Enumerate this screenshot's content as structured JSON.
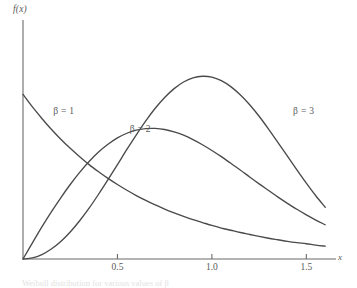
{
  "figure": {
    "background": "#ffffff",
    "curve_color": "#4a4a4a",
    "axis_color": "#6b6b6b",
    "text_color": "#5a5a5a",
    "caption": "Weibull distribution for various values of β"
  },
  "axes": {
    "ylabel": "f(x)",
    "xlabel": "x",
    "xticks": [
      {
        "value": 0.5,
        "label": "0.5"
      },
      {
        "value": 1.0,
        "label": "1.0"
      },
      {
        "value": 1.5,
        "label": "1.5"
      }
    ]
  },
  "chart_data": {
    "type": "line",
    "title": "",
    "xlabel": "x",
    "ylabel": "f(x)",
    "xlim": [
      0,
      1.62
    ],
    "ylim": [
      0,
      1.0
    ],
    "grid": false,
    "legend": "inline-annotations",
    "x": [
      0.0,
      0.05,
      0.1,
      0.15,
      0.2,
      0.25,
      0.3,
      0.35,
      0.4,
      0.45,
      0.5,
      0.55,
      0.6,
      0.65,
      0.7,
      0.75,
      0.8,
      0.85,
      0.9,
      0.95,
      1.0,
      1.05,
      1.1,
      1.15,
      1.2,
      1.25,
      1.3,
      1.35,
      1.4,
      1.45,
      1.5,
      1.55,
      1.6
    ],
    "series": [
      {
        "name": "β = 1",
        "label": "β = 1",
        "label_x": 0.16,
        "label_y": 0.665,
        "values": [
          0.745,
          0.688,
          0.636,
          0.587,
          0.542,
          0.501,
          0.463,
          0.427,
          0.395,
          0.365,
          0.337,
          0.311,
          0.287,
          0.265,
          0.245,
          0.226,
          0.209,
          0.193,
          0.178,
          0.165,
          0.152,
          0.14,
          0.13,
          0.12,
          0.111,
          0.102,
          0.094,
          0.087,
          0.08,
          0.074,
          0.069,
          0.063,
          0.058
        ]
      },
      {
        "name": "β = 2",
        "label": "β = 2",
        "label_x": 0.565,
        "label_y": 0.585,
        "values": [
          0.0,
          0.073,
          0.145,
          0.213,
          0.277,
          0.337,
          0.392,
          0.441,
          0.484,
          0.519,
          0.548,
          0.569,
          0.583,
          0.59,
          0.591,
          0.586,
          0.575,
          0.56,
          0.54,
          0.517,
          0.491,
          0.463,
          0.433,
          0.403,
          0.371,
          0.34,
          0.31,
          0.28,
          0.252,
          0.225,
          0.2,
          0.176,
          0.155
        ]
      },
      {
        "name": "β = 3",
        "label": "β = 3",
        "label_x": 1.43,
        "label_y": 0.665,
        "values": [
          0.0,
          0.005,
          0.02,
          0.045,
          0.079,
          0.122,
          0.173,
          0.23,
          0.293,
          0.359,
          0.427,
          0.496,
          0.562,
          0.625,
          0.682,
          0.731,
          0.771,
          0.801,
          0.82,
          0.827,
          0.823,
          0.807,
          0.78,
          0.743,
          0.698,
          0.646,
          0.588,
          0.527,
          0.465,
          0.403,
          0.343,
          0.286,
          0.234
        ]
      }
    ]
  }
}
